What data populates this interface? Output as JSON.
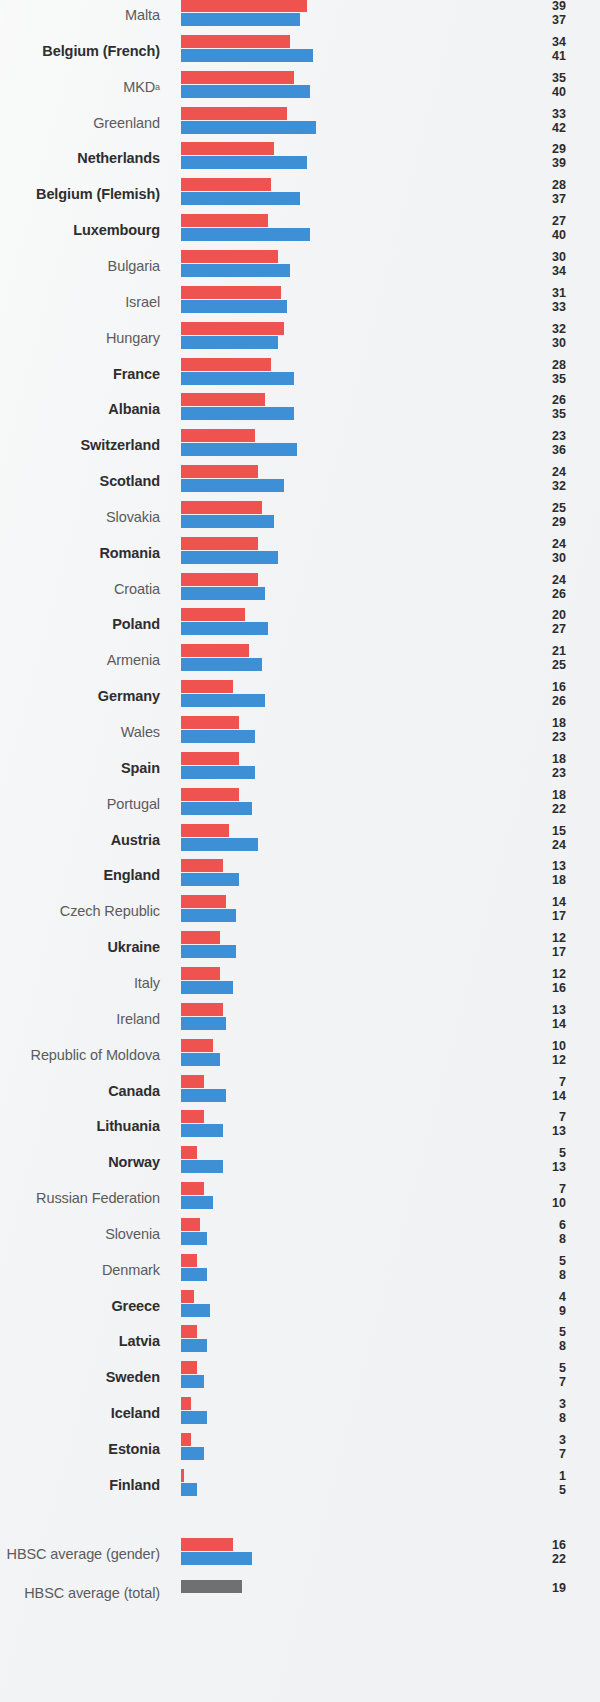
{
  "chart_data": {
    "type": "bar",
    "title": "",
    "subtitle": "",
    "xlabel": "",
    "ylabel": "",
    "orientation": "horizontal",
    "grid": false,
    "legend_position": "none",
    "xlim": [
      0,
      42
    ],
    "series": [
      {
        "name": "boys",
        "color": "#ef5350"
      },
      {
        "name": "girls",
        "color": "#3e90d6"
      },
      {
        "name": "total",
        "color": "#6f7072"
      }
    ],
    "categories": [
      "Malta",
      "Belgium (French)",
      "MKD",
      "Greenland",
      "Netherlands",
      "Belgium (Flemish)",
      "Luxembourg",
      "Bulgaria",
      "Israel",
      "Hungary",
      "France",
      "Albania",
      "Switzerland",
      "Scotland",
      "Slovakia",
      "Romania",
      "Croatia",
      "Poland",
      "Armenia",
      "Germany",
      "Wales",
      "Spain",
      "Portugal",
      "Austria",
      "England",
      "Czech Republic",
      "Ukraine",
      "Italy",
      "Ireland",
      "Republic of Moldova",
      "Canada",
      "Lithuania",
      "Norway",
      "Russian Federation",
      "Slovenia",
      "Denmark",
      "Greece",
      "Latvia",
      "Sweden",
      "Iceland",
      "Estonia",
      "Finland"
    ],
    "rows": [
      {
        "label": "Malta",
        "bold": false,
        "sup": "",
        "boys": 39,
        "girls": 37
      },
      {
        "label": "Belgium (French)",
        "bold": true,
        "sup": "",
        "boys": 34,
        "girls": 41
      },
      {
        "label": "MKD",
        "bold": false,
        "sup": "a",
        "boys": 35,
        "girls": 40
      },
      {
        "label": "Greenland",
        "bold": false,
        "sup": "",
        "boys": 33,
        "girls": 42
      },
      {
        "label": "Netherlands",
        "bold": true,
        "sup": "",
        "boys": 29,
        "girls": 39
      },
      {
        "label": "Belgium (Flemish)",
        "bold": true,
        "sup": "",
        "boys": 28,
        "girls": 37
      },
      {
        "label": "Luxembourg",
        "bold": true,
        "sup": "",
        "boys": 27,
        "girls": 40
      },
      {
        "label": "Bulgaria",
        "bold": false,
        "sup": "",
        "boys": 30,
        "girls": 34
      },
      {
        "label": "Israel",
        "bold": false,
        "sup": "",
        "boys": 31,
        "girls": 33
      },
      {
        "label": "Hungary",
        "bold": false,
        "sup": "",
        "boys": 32,
        "girls": 30
      },
      {
        "label": "France",
        "bold": true,
        "sup": "",
        "boys": 28,
        "girls": 35
      },
      {
        "label": "Albania",
        "bold": true,
        "sup": "",
        "boys": 26,
        "girls": 35
      },
      {
        "label": "Switzerland",
        "bold": true,
        "sup": "",
        "boys": 23,
        "girls": 36
      },
      {
        "label": "Scotland",
        "bold": true,
        "sup": "",
        "boys": 24,
        "girls": 32
      },
      {
        "label": "Slovakia",
        "bold": false,
        "sup": "",
        "boys": 25,
        "girls": 29
      },
      {
        "label": "Romania",
        "bold": true,
        "sup": "",
        "boys": 24,
        "girls": 30
      },
      {
        "label": "Croatia",
        "bold": false,
        "sup": "",
        "boys": 24,
        "girls": 26
      },
      {
        "label": "Poland",
        "bold": true,
        "sup": "",
        "boys": 20,
        "girls": 27
      },
      {
        "label": "Armenia",
        "bold": false,
        "sup": "",
        "boys": 21,
        "girls": 25
      },
      {
        "label": "Germany",
        "bold": true,
        "sup": "",
        "boys": 16,
        "girls": 26
      },
      {
        "label": "Wales",
        "bold": false,
        "sup": "",
        "boys": 18,
        "girls": 23
      },
      {
        "label": "Spain",
        "bold": true,
        "sup": "",
        "boys": 18,
        "girls": 23
      },
      {
        "label": "Portugal",
        "bold": false,
        "sup": "",
        "boys": 18,
        "girls": 22
      },
      {
        "label": "Austria",
        "bold": true,
        "sup": "",
        "boys": 15,
        "girls": 24
      },
      {
        "label": "England",
        "bold": true,
        "sup": "",
        "boys": 13,
        "girls": 18
      },
      {
        "label": "Czech Republic",
        "bold": false,
        "sup": "",
        "boys": 14,
        "girls": 17
      },
      {
        "label": "Ukraine",
        "bold": true,
        "sup": "",
        "boys": 12,
        "girls": 17
      },
      {
        "label": "Italy",
        "bold": false,
        "sup": "",
        "boys": 12,
        "girls": 16
      },
      {
        "label": "Ireland",
        "bold": false,
        "sup": "",
        "boys": 13,
        "girls": 14
      },
      {
        "label": "Republic of Moldova",
        "bold": false,
        "sup": "",
        "boys": 10,
        "girls": 12
      },
      {
        "label": "Canada",
        "bold": true,
        "sup": "",
        "boys": 7,
        "girls": 14
      },
      {
        "label": "Lithuania",
        "bold": true,
        "sup": "",
        "boys": 7,
        "girls": 13
      },
      {
        "label": "Norway",
        "bold": true,
        "sup": "",
        "boys": 5,
        "girls": 13
      },
      {
        "label": "Russian Federation",
        "bold": false,
        "sup": "",
        "boys": 7,
        "girls": 10
      },
      {
        "label": "Slovenia",
        "bold": false,
        "sup": "",
        "boys": 6,
        "girls": 8
      },
      {
        "label": "Denmark",
        "bold": false,
        "sup": "",
        "boys": 5,
        "girls": 8
      },
      {
        "label": "Greece",
        "bold": true,
        "sup": "",
        "boys": 4,
        "girls": 9
      },
      {
        "label": "Latvia",
        "bold": true,
        "sup": "",
        "boys": 5,
        "girls": 8
      },
      {
        "label": "Sweden",
        "bold": true,
        "sup": "",
        "boys": 5,
        "girls": 7
      },
      {
        "label": "Iceland",
        "bold": true,
        "sup": "",
        "boys": 3,
        "girls": 8
      },
      {
        "label": "Estonia",
        "bold": true,
        "sup": "",
        "boys": 3,
        "girls": 7
      },
      {
        "label": "Finland",
        "bold": true,
        "sup": "",
        "boys": 1,
        "girls": 5
      }
    ],
    "summary_rows": [
      {
        "label": "HBSC average (gender)",
        "bold": false,
        "sup": "",
        "boys": 16,
        "girls": 22
      },
      {
        "label": "HBSC average (total)",
        "bold": false,
        "sup": "",
        "total": 19
      }
    ]
  }
}
